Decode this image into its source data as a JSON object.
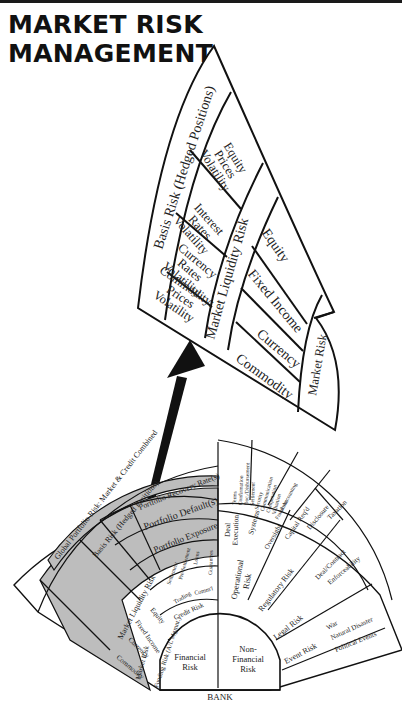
{
  "title": {
    "line1": "MARKET RISK",
    "line2": "MANAGEMENT"
  },
  "colors": {
    "ink": "#111111",
    "shade": "#bdbdbd",
    "paper": "#ffffff"
  },
  "zoom_panel": {
    "outer_band": "Basis Risk (Hedged Positions)",
    "volatility": [
      "Equity Prices Volatility",
      "Interest Rates Volatility",
      "Currency Rates Volatility",
      "Commodity: Prices Volatility"
    ],
    "middle_band": "Market Liquidity Risk",
    "asset_classes": [
      "Equity",
      "Fixed Income",
      "Currency",
      "Commodity"
    ],
    "inner_band": "Market Risk"
  },
  "fan": {
    "base": "BANK",
    "core": {
      "left": "Financial Risk",
      "right": "Non-Financial Risk"
    },
    "financial": {
      "funding": "Funding Risk (A/L Mgmnt.)",
      "credit": "Credit Risk",
      "credit_sub": [
        "Trading",
        "Comm'l"
      ],
      "credit_outer": [
        "Settlement",
        "Pre-Settlement",
        "Loans",
        "Guarantees"
      ],
      "portfolio": [
        "Portfolio Exposure",
        "Portfolio Default(s)",
        "Portfolio Recovery Rate(s)"
      ],
      "market": "Market Risk",
      "assets": [
        "Equity",
        "Fixed Income",
        "Currency",
        "Commodity"
      ],
      "liquidity": "Market Liquidity Risk",
      "volatility": [
        "Equity Prices Volatility",
        "Interest Rates Volatility",
        "Currency Rates Volatility",
        "Commodity Prices Volatility"
      ],
      "basis": "Basis Risk (Hedged Positions)",
      "global": "Global Portfolio Risk: Market & Credit Combined"
    },
    "non_financial": {
      "operational": "Operational Risk",
      "op_inner": [
        "Deal Execution",
        "Systems",
        "Oversight"
      ],
      "op_outer": [
        "Terms Confirmation Doc./Disbursement Settlement",
        "Security Communication Computation Valuation",
        "Fraud Limits Accounting"
      ],
      "regulatory": "Regulatory Risk",
      "reg_items": [
        "Capital Req'd",
        "Disclosure",
        "Taxation"
      ],
      "legal": "Legal Risk",
      "legal_items": [
        "Deal/Contract",
        "Enforceability"
      ],
      "event": "Event Risk",
      "event_items": [
        "War",
        "Natural Disaster",
        "Political Events"
      ]
    }
  }
}
